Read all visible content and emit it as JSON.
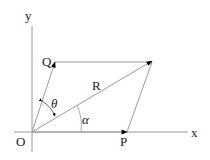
{
  "diagram": {
    "type": "vector-parallelogram",
    "labels": {
      "origin": "O",
      "x_axis": "x",
      "y_axis": "y",
      "vector_p": "P",
      "vector_q": "Q",
      "resultant": "R",
      "angle_theta": "θ",
      "angle_alpha": "α"
    },
    "points": {
      "O": [
        32,
        132
      ],
      "P": [
        127,
        132
      ],
      "Q": [
        55,
        62
      ],
      "R": [
        152,
        61
      ]
    },
    "colors": {
      "line": "#9a9a9a",
      "arrow": "#000000",
      "text": "#222222"
    }
  }
}
